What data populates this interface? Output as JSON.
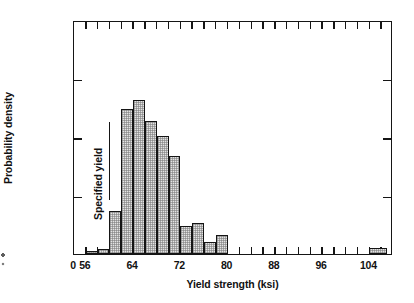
{
  "chart_data": {
    "type": "bar",
    "title": "",
    "subtitle": "",
    "xlabel": "Yield strength (ksi)",
    "ylabel": "Probability density",
    "grid": false,
    "legend": null,
    "xlim": [
      54,
      108
    ],
    "ylim": [
      0,
      0.1
    ],
    "x_tick_labels": [
      "0",
      "56",
      "64",
      "72",
      "80",
      "88",
      "96",
      "104"
    ],
    "x_tick_values": [
      54,
      56,
      64,
      72,
      80,
      88,
      96,
      104
    ],
    "x_minor_tick_spacing": 2,
    "y_tick_labels": [
      "0",
      "0.025",
      "0.050",
      "0.075",
      "0.100"
    ],
    "y_tick_values": [
      0,
      0.025,
      0.05,
      0.075,
      0.1
    ],
    "bin_width": 2,
    "bins": [
      {
        "left": 56,
        "right": 58,
        "value": 0.0012
      },
      {
        "left": 58,
        "right": 60,
        "value": 0.002
      },
      {
        "left": 60,
        "right": 62,
        "value": 0.0185
      },
      {
        "left": 62,
        "right": 64,
        "value": 0.062
      },
      {
        "left": 64,
        "right": 66,
        "value": 0.066
      },
      {
        "left": 66,
        "right": 68,
        "value": 0.057
      },
      {
        "left": 68,
        "right": 70,
        "value": 0.0505
      },
      {
        "left": 70,
        "right": 72,
        "value": 0.042
      },
      {
        "left": 72,
        "right": 74,
        "value": 0.0118
      },
      {
        "left": 74,
        "right": 76,
        "value": 0.0132
      },
      {
        "left": 76,
        "right": 78,
        "value": 0.0052
      },
      {
        "left": 78,
        "right": 80,
        "value": 0.008
      },
      {
        "left": 104,
        "right": 107,
        "value": 0.0025
      }
    ],
    "categories": [
      "56-58",
      "58-60",
      "60-62",
      "62-64",
      "64-66",
      "66-68",
      "68-70",
      "70-72",
      "72-74",
      "74-76",
      "76-78",
      "78-80",
      "104-107"
    ],
    "values": [
      0.0012,
      0.002,
      0.0185,
      0.062,
      0.066,
      0.057,
      0.0505,
      0.042,
      0.0118,
      0.0132,
      0.0052,
      0.008,
      0.0025
    ],
    "annotations": [
      {
        "text": "Specified yield",
        "x": 60,
        "orientation": "vertical",
        "line": true
      }
    ]
  }
}
